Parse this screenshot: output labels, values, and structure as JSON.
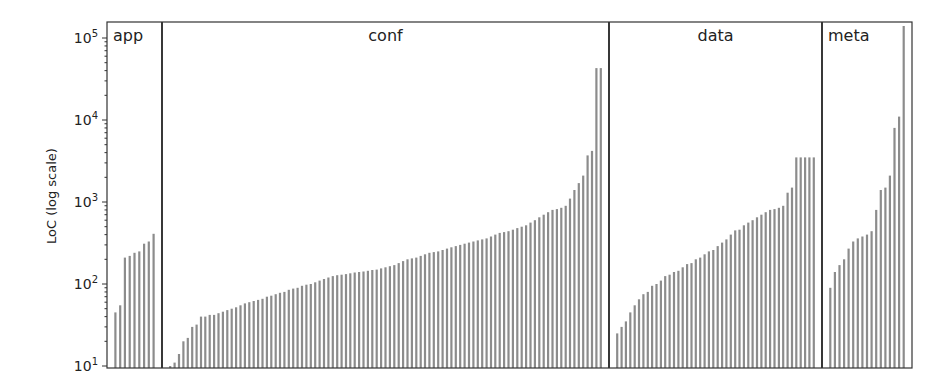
{
  "chart_data": {
    "type": "bar",
    "title": "",
    "xlabel": "",
    "ylabel": "LoC (log scale)",
    "yscale": "log",
    "ylim": [
      10,
      160000
    ],
    "yticks": [
      {
        "base": "10",
        "exp": "1",
        "value": 10
      },
      {
        "base": "10",
        "exp": "2",
        "value": 100
      },
      {
        "base": "10",
        "exp": "3",
        "value": 1000
      },
      {
        "base": "10",
        "exp": "4",
        "value": 10000
      },
      {
        "base": "10",
        "exp": "5",
        "value": 100000
      }
    ],
    "grid": false,
    "legend": null,
    "bar_color": "#8c8c8c",
    "separator_color": "#222222",
    "groups": [
      {
        "name": "app",
        "values": [
          45,
          55,
          210,
          220,
          240,
          250,
          310,
          330,
          410
        ]
      },
      {
        "name": "conf",
        "values": [
          10,
          11,
          14,
          20,
          22,
          30,
          32,
          40,
          40,
          42,
          42,
          44,
          46,
          48,
          50,
          52,
          55,
          58,
          60,
          62,
          64,
          66,
          70,
          72,
          75,
          78,
          80,
          85,
          88,
          90,
          95,
          98,
          100,
          105,
          110,
          115,
          120,
          125,
          128,
          130,
          132,
          135,
          138,
          140,
          142,
          145,
          148,
          150,
          155,
          160,
          165,
          170,
          180,
          190,
          200,
          205,
          210,
          220,
          230,
          240,
          245,
          250,
          260,
          270,
          280,
          290,
          300,
          310,
          320,
          330,
          340,
          350,
          360,
          380,
          400,
          420,
          430,
          440,
          460,
          480,
          500,
          520,
          560,
          600,
          650,
          700,
          750,
          800,
          820,
          850,
          900,
          1100,
          1400,
          1700,
          2100,
          3700,
          4200,
          43000,
          43000
        ]
      },
      {
        "name": "data",
        "values": [
          25,
          30,
          35,
          45,
          55,
          65,
          75,
          80,
          95,
          100,
          110,
          125,
          130,
          140,
          145,
          160,
          175,
          180,
          200,
          210,
          230,
          250,
          260,
          290,
          320,
          350,
          400,
          450,
          460,
          520,
          560,
          600,
          650,
          700,
          750,
          800,
          820,
          850,
          900,
          1300,
          1500,
          3500,
          3500,
          3500,
          3500,
          3500
        ]
      },
      {
        "name": "meta",
        "values": [
          90,
          140,
          170,
          200,
          270,
          330,
          360,
          380,
          400,
          440,
          800,
          1400,
          1500,
          2100,
          8000,
          11000,
          140000
        ]
      }
    ]
  }
}
